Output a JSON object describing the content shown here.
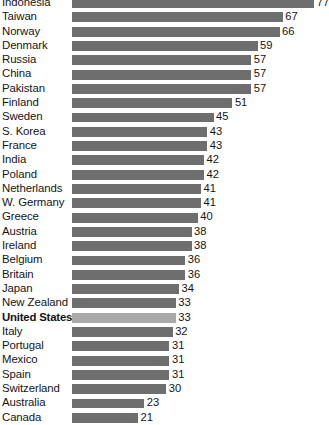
{
  "chart_data": {
    "type": "bar",
    "orientation": "horizontal",
    "title": "",
    "subtitle": "",
    "xlabel": "",
    "ylabel": "",
    "grid": false,
    "legend": null,
    "xlim": [
      0,
      77
    ],
    "value_labels_shown": true,
    "highlight_category": "United States",
    "colors": {
      "bar": "#6e6e6e",
      "bar_highlight": "#a9a9a9",
      "text": "#141414",
      "background": "#ffffff"
    },
    "categories": [
      "Indonesia",
      "Taiwan",
      "Norway",
      "Denmark",
      "Russia",
      "China",
      "Pakistan",
      "Finland",
      "Sweden",
      "S. Korea",
      "France",
      "India",
      "Poland",
      "Netherlands",
      "W. Germany",
      "Greece",
      "Austria",
      "Ireland",
      "Belgium",
      "Britain",
      "Japan",
      "New Zealand",
      "United States",
      "Italy",
      "Portugal",
      "Mexico",
      "Spain",
      "Switzerland",
      "Australia",
      "Canada"
    ],
    "values": [
      77,
      67,
      66,
      59,
      57,
      57,
      57,
      51,
      45,
      43,
      43,
      42,
      42,
      41,
      41,
      40,
      38,
      38,
      36,
      36,
      34,
      33,
      33,
      32,
      31,
      31,
      31,
      30,
      23,
      21
    ]
  }
}
